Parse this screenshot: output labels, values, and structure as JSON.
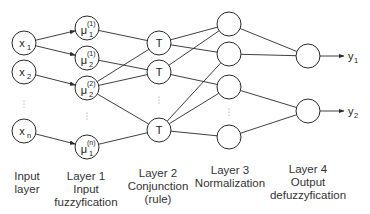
{
  "colors": {
    "stroke": "#2a2a2a",
    "text": "#222222",
    "caption": "#333333",
    "background": "#ffffff"
  },
  "input_nodes": [
    {
      "id": "x1",
      "base": "x",
      "sub": "1",
      "cx": 24,
      "cy": 43
    },
    {
      "id": "x2",
      "base": "x",
      "sub": "2",
      "cx": 24,
      "cy": 72
    },
    {
      "id": "xn",
      "base": "x",
      "sub": "n",
      "cx": 24,
      "cy": 131
    }
  ],
  "layer1_nodes": [
    {
      "id": "m11",
      "base": "μ",
      "sub": "1",
      "sup": "(1)",
      "cx": 87,
      "cy": 28
    },
    {
      "id": "m21",
      "base": "μ",
      "sub": "2",
      "sup": "(1)",
      "cx": 87,
      "cy": 58
    },
    {
      "id": "m22",
      "base": "μ",
      "sub": "2",
      "sup": "(2)",
      "cx": 87,
      "cy": 88
    },
    {
      "id": "m1n",
      "base": "μ",
      "sub": "1",
      "sup": "(n)",
      "cx": 87,
      "cy": 147
    }
  ],
  "layer2_nodes": [
    {
      "id": "T1",
      "label": "T",
      "cx": 159,
      "cy": 43
    },
    {
      "id": "T2",
      "label": "T",
      "cx": 159,
      "cy": 72
    },
    {
      "id": "T3",
      "label": "T",
      "cx": 159,
      "cy": 130
    }
  ],
  "layer3_nodes": [
    {
      "id": "N1",
      "cx": 229,
      "cy": 24
    },
    {
      "id": "N2",
      "cx": 229,
      "cy": 54
    },
    {
      "id": "N3",
      "cx": 229,
      "cy": 87
    },
    {
      "id": "N4",
      "cx": 229,
      "cy": 137
    }
  ],
  "layer4_nodes": [
    {
      "id": "O1",
      "cx": 308,
      "cy": 56
    },
    {
      "id": "O2",
      "cx": 308,
      "cy": 111
    }
  ],
  "outputs": [
    {
      "id": "y1",
      "base": "y",
      "sub": "1",
      "from": "O1"
    },
    {
      "id": "y2",
      "base": "y",
      "sub": "2",
      "from": "O2"
    }
  ],
  "edges": [
    [
      "x1",
      "m11"
    ],
    [
      "x1",
      "m21"
    ],
    [
      "x2",
      "m22"
    ],
    [
      "xn",
      "m1n"
    ],
    [
      "m11",
      "T1"
    ],
    [
      "m21",
      "T2"
    ],
    [
      "m22",
      "T1"
    ],
    [
      "m22",
      "T2"
    ],
    [
      "m22",
      "T3"
    ],
    [
      "m1n",
      "T3"
    ],
    [
      "T1",
      "N1"
    ],
    [
      "T1",
      "N2"
    ],
    [
      "T2",
      "N1"
    ],
    [
      "T2",
      "N3"
    ],
    [
      "T3",
      "N2"
    ],
    [
      "T3",
      "N3"
    ],
    [
      "T3",
      "N4"
    ],
    [
      "N1",
      "O1"
    ],
    [
      "N2",
      "O1"
    ],
    [
      "N3",
      "O2"
    ],
    [
      "N4",
      "O2"
    ]
  ],
  "ellipses": [
    {
      "x": 24,
      "y": 101
    },
    {
      "x": 87,
      "y": 113
    },
    {
      "x": 159,
      "y": 97
    },
    {
      "x": 229,
      "y": 109
    }
  ],
  "captions": [
    {
      "id": "input-layer",
      "x": 27,
      "lines": [
        "Input",
        "layer"
      ],
      "y0": 180
    },
    {
      "id": "layer-1",
      "x": 86,
      "lines": [
        "Layer 1",
        "Input",
        "fuzzyfication"
      ],
      "y0": 180
    },
    {
      "id": "layer-2",
      "x": 158,
      "lines": [
        "Layer 2",
        "Conjunction",
        "(rule)"
      ],
      "y0": 177
    },
    {
      "id": "layer-3",
      "x": 230,
      "lines": [
        "Layer 3",
        "Normalization"
      ],
      "y0": 174
    },
    {
      "id": "layer-4",
      "x": 308,
      "lines": [
        "Layer 4",
        "Output",
        "defuzzyfication"
      ],
      "y0": 173
    }
  ]
}
